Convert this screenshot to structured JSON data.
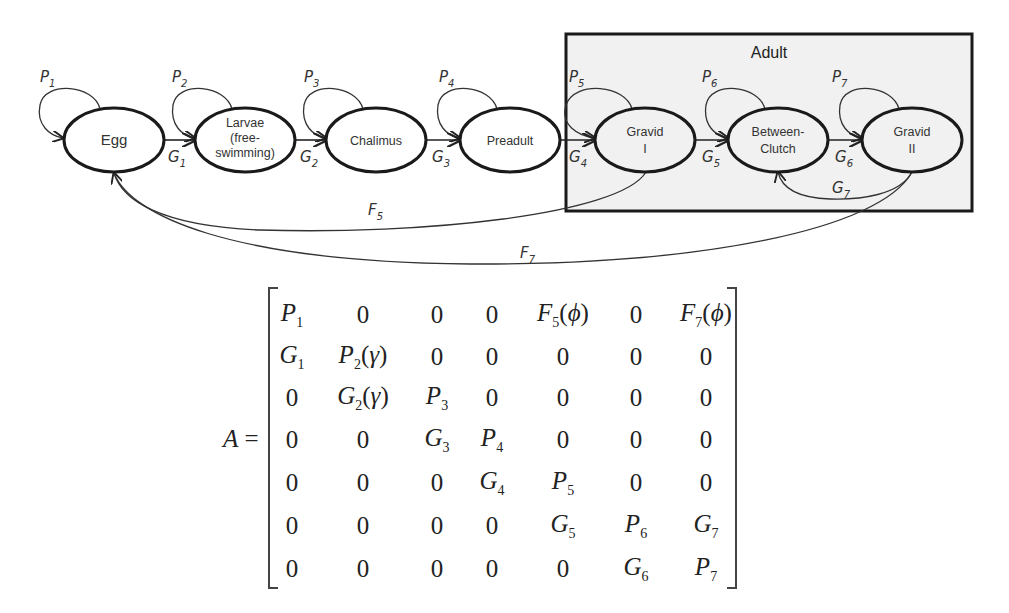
{
  "diagram": {
    "group_box": {
      "label": "Adult",
      "fill": "#f1f1f1",
      "border": "#1a1a1a"
    },
    "stages": [
      {
        "id": "egg",
        "lines": [
          "Egg"
        ],
        "self_loop": "P",
        "self_loop_sub": "1"
      },
      {
        "id": "larvae",
        "lines": [
          "Larvae",
          "(free-",
          "swimming)"
        ],
        "self_loop": "P",
        "self_loop_sub": "2"
      },
      {
        "id": "chalimus",
        "lines": [
          "Chalimus"
        ],
        "self_loop": "P",
        "self_loop_sub": "3"
      },
      {
        "id": "preadult",
        "lines": [
          "Preadult"
        ],
        "self_loop": "P",
        "self_loop_sub": "4"
      },
      {
        "id": "gravid-1",
        "lines": [
          "Gravid",
          "I"
        ],
        "self_loop": "P",
        "self_loop_sub": "5"
      },
      {
        "id": "between-clutch",
        "lines": [
          "Between-",
          "Clutch"
        ],
        "self_loop": "P",
        "self_loop_sub": "6"
      },
      {
        "id": "gravid-2",
        "lines": [
          "Gravid",
          "II"
        ],
        "self_loop": "P",
        "self_loop_sub": "7"
      }
    ],
    "transitions": [
      {
        "from": "egg",
        "to": "larvae",
        "label": "G",
        "sub": "1"
      },
      {
        "from": "larvae",
        "to": "chalimus",
        "label": "G",
        "sub": "2"
      },
      {
        "from": "chalimus",
        "to": "preadult",
        "label": "G",
        "sub": "3"
      },
      {
        "from": "preadult",
        "to": "gravid-1",
        "label": "G",
        "sub": "4"
      },
      {
        "from": "gravid-1",
        "to": "between-clutch",
        "label": "G",
        "sub": "5"
      },
      {
        "from": "between-clutch",
        "to": "gravid-2",
        "label": "G",
        "sub": "6"
      },
      {
        "from": "gravid-2",
        "to": "between-clutch",
        "label": "G",
        "sub": "7"
      },
      {
        "from": "gravid-1",
        "to": "egg",
        "label": "F",
        "sub": "5"
      },
      {
        "from": "gravid-2",
        "to": "egg",
        "label": "F",
        "sub": "7"
      }
    ]
  },
  "matrix": {
    "lhs": "A",
    "equals": "=",
    "rows": [
      [
        {
          "v": "P",
          "s": "1"
        },
        {
          "t": "0"
        },
        {
          "t": "0"
        },
        {
          "t": "0"
        },
        {
          "v": "F",
          "s": "5",
          "arg": "ϕ"
        },
        {
          "t": "0"
        },
        {
          "v": "F",
          "s": "7",
          "arg": "ϕ"
        }
      ],
      [
        {
          "v": "G",
          "s": "1"
        },
        {
          "v": "P",
          "s": "2",
          "arg": "γ"
        },
        {
          "t": "0"
        },
        {
          "t": "0"
        },
        {
          "t": "0"
        },
        {
          "t": "0"
        },
        {
          "t": "0"
        }
      ],
      [
        {
          "t": "0"
        },
        {
          "v": "G",
          "s": "2",
          "arg": "γ"
        },
        {
          "v": "P",
          "s": "3"
        },
        {
          "t": "0"
        },
        {
          "t": "0"
        },
        {
          "t": "0"
        },
        {
          "t": "0"
        }
      ],
      [
        {
          "t": "0"
        },
        {
          "t": "0"
        },
        {
          "v": "G",
          "s": "3"
        },
        {
          "v": "P",
          "s": "4"
        },
        {
          "t": "0"
        },
        {
          "t": "0"
        },
        {
          "t": "0"
        }
      ],
      [
        {
          "t": "0"
        },
        {
          "t": "0"
        },
        {
          "t": "0"
        },
        {
          "v": "G",
          "s": "4"
        },
        {
          "v": "P",
          "s": "5"
        },
        {
          "t": "0"
        },
        {
          "t": "0"
        }
      ],
      [
        {
          "t": "0"
        },
        {
          "t": "0"
        },
        {
          "t": "0"
        },
        {
          "t": "0"
        },
        {
          "v": "G",
          "s": "5"
        },
        {
          "v": "P",
          "s": "6"
        },
        {
          "v": "G",
          "s": "7"
        }
      ],
      [
        {
          "t": "0"
        },
        {
          "t": "0"
        },
        {
          "t": "0"
        },
        {
          "t": "0"
        },
        {
          "t": "0"
        },
        {
          "v": "G",
          "s": "6"
        },
        {
          "v": "P",
          "s": "7"
        }
      ]
    ]
  }
}
